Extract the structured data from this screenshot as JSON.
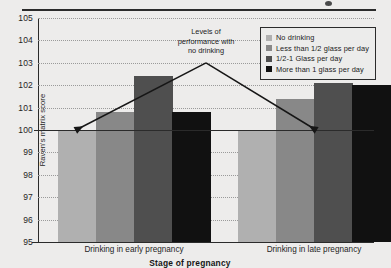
{
  "chart_data": {
    "type": "bar",
    "title": "",
    "xlabel": "Stage of pregnancy",
    "ylabel": "Raven's matrix score",
    "ylim": [
      95,
      105
    ],
    "yticks": [
      95,
      96,
      97,
      98,
      99,
      100,
      101,
      102,
      103,
      104,
      105
    ],
    "grid": true,
    "legend_position": "top-right",
    "categories": [
      "Drinking in early pregnancy",
      "Drinking in late pregnancy"
    ],
    "series": [
      {
        "name": "No drinking",
        "color": "#b0b0b0",
        "values": [
          100.0,
          100.0
        ]
      },
      {
        "name": "Less than 1/2 glass per day",
        "color": "#888888",
        "values": [
          100.8,
          101.4
        ]
      },
      {
        "name": "1/2-1 Glass per day",
        "color": "#4f4f4f",
        "values": [
          102.4,
          102.1
        ]
      },
      {
        "name": "More than 1 glass per day",
        "color": "#111111",
        "values": [
          100.8,
          102.0
        ]
      }
    ],
    "reference_line": {
      "value": 100,
      "label": "Levels of performance with no drinking"
    },
    "annotation": {
      "line1": "Levels of",
      "line2": "performance with",
      "line3": "no drinking"
    }
  },
  "legend": {
    "items": [
      {
        "label": "No drinking",
        "color": "#b0b0b0"
      },
      {
        "label": "Less than 1/2 glass per day",
        "color": "#888888"
      },
      {
        "label": "1/2-1 Glass per day",
        "color": "#4f4f4f"
      },
      {
        "label": "More than 1 glass per day",
        "color": "#111111"
      }
    ]
  }
}
